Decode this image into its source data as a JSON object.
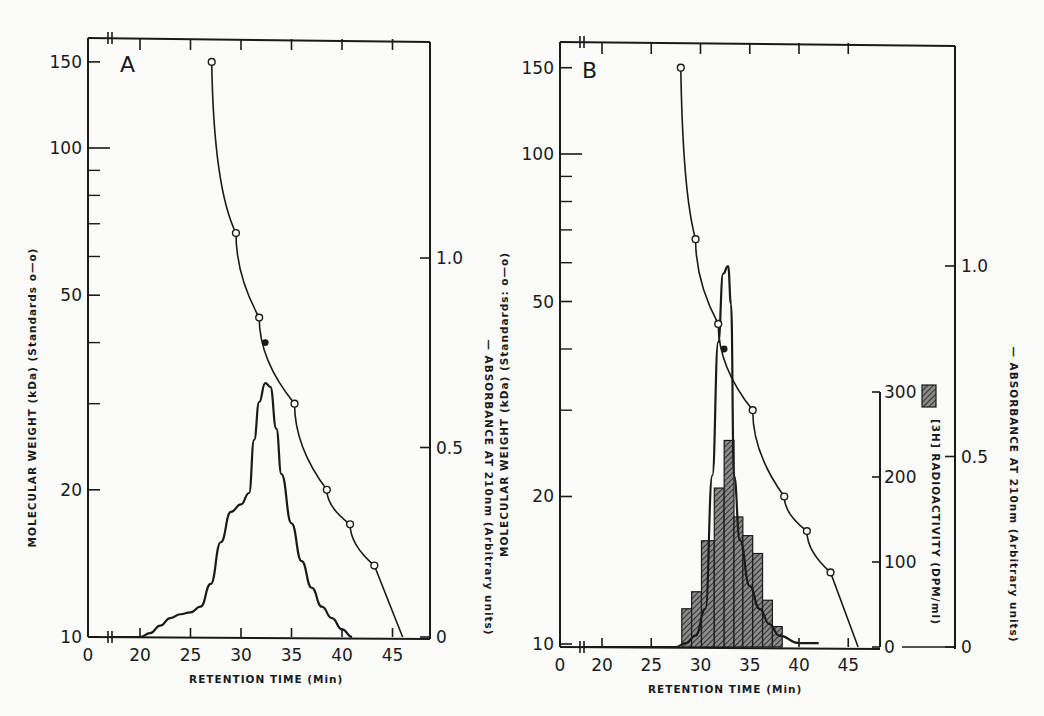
{
  "figure": {
    "panels": [
      {
        "label": "A",
        "xlabel": "RETENTION TIME (Min)",
        "ylabel_left": "MOLECULAR WEIGHT (kDa) (Standards o—o)",
        "ylabel_right": "— ABSORBANCE AT 210nm (Arbitrary units)",
        "x_ticks": [
          "0",
          "20",
          "25",
          "30",
          "35",
          "40",
          "45"
        ],
        "y_left_ticks": [
          "150",
          "100",
          "50",
          "20",
          "10"
        ],
        "y_right_ticks": [
          "1.0",
          "0.5",
          "0"
        ]
      },
      {
        "label": "B",
        "xlabel": "RETENTION TIME (Min)",
        "ylabel_left": "MOLECULAR WEIGHT (kDa) (Standards: o—o)",
        "ylabel_right": "— ABSORBANCE AT 210nm (Arbitrary units)",
        "ylabel_radio": "[3H] RADIOACTIVITY (DPM/ml)",
        "x_ticks": [
          "0",
          "20",
          "25",
          "30",
          "35",
          "40",
          "45"
        ],
        "y_left_ticks": [
          "150",
          "100",
          "50",
          "20",
          "10"
        ],
        "y_right_ticks": [
          "1.0",
          "0.5",
          "0"
        ],
        "y_radio_ticks": [
          "300",
          "200",
          "100",
          "0"
        ]
      }
    ]
  },
  "chart_data": [
    {
      "type": "line",
      "title": "A",
      "xlabel": "RETENTION TIME (Min)",
      "ylabel": "MOLECULAR WEIGHT (kDa) (Standards)",
      "y2label": "ABSORBANCE AT 210nm (Arbitrary units)",
      "xlim": [
        0,
        48
      ],
      "x_axis_break": "between 0 and 20",
      "ylim": [
        10,
        160
      ],
      "yscale": "log",
      "y2lim": [
        0,
        1.3
      ],
      "grid": false,
      "series": [
        {
          "name": "Standards (MW, kDa)",
          "marker": "open circle",
          "x": [
            27.1,
            29.5,
            31.8,
            35.3,
            38.5,
            40.8,
            43.2
          ],
          "y": [
            150,
            67,
            45,
            30,
            20,
            17,
            14
          ]
        },
        {
          "name": "Sample (filled point)",
          "marker": "filled circle",
          "x": [
            32.4
          ],
          "y": [
            40
          ]
        },
        {
          "name": "Absorbance at 210nm",
          "axis": "right",
          "x": [
            17,
            20,
            21,
            22,
            23,
            24,
            25,
            26,
            27,
            28,
            29,
            30,
            30.8,
            31.3,
            31.8,
            32.4,
            32.9,
            33.5,
            34.0,
            35.0,
            36.0,
            37.0,
            38.0,
            39.0,
            40.0,
            41.0
          ],
          "y": [
            0,
            0,
            0.01,
            0.03,
            0.05,
            0.06,
            0.065,
            0.08,
            0.14,
            0.25,
            0.33,
            0.35,
            0.38,
            0.52,
            0.62,
            0.67,
            0.66,
            0.55,
            0.43,
            0.3,
            0.2,
            0.13,
            0.08,
            0.05,
            0.02,
            0
          ]
        }
      ]
    },
    {
      "type": "line",
      "title": "B",
      "xlabel": "RETENTION TIME (Min)",
      "ylabel": "MOLECULAR WEIGHT (kDa) (Standards)",
      "y2label": "ABSORBANCE AT 210nm (Arbitrary units)",
      "y3label": "[3H] RADIOACTIVITY (DPM/ml)",
      "xlim": [
        0,
        48
      ],
      "x_axis_break": "between 0 and 20",
      "ylim": [
        10,
        160
      ],
      "yscale": "log",
      "y2lim": [
        0,
        1.3
      ],
      "y3lim": [
        0,
        300
      ],
      "grid": false,
      "series": [
        {
          "name": "Standards (MW, kDa)",
          "marker": "open circle",
          "x": [
            28.0,
            29.5,
            31.8,
            35.3,
            38.5,
            40.8,
            43.2
          ],
          "y": [
            150,
            67,
            45,
            30,
            20,
            17,
            14
          ]
        },
        {
          "name": "Sample (filled point)",
          "marker": "filled circle",
          "x": [
            32.4
          ],
          "y": [
            40
          ]
        },
        {
          "name": "Absorbance at 210nm",
          "axis": "right",
          "x": [
            17,
            20,
            25,
            27.5,
            28.5,
            29.5,
            30.5,
            31.2,
            31.8,
            32.3,
            32.8,
            33.1,
            33.4,
            34.0,
            35.0,
            36.0,
            37.0,
            38.0,
            40.0,
            42.0
          ],
          "y": [
            0,
            0,
            0,
            0,
            0.01,
            0.03,
            0.1,
            0.45,
            0.8,
            0.98,
            1.0,
            0.9,
            0.45,
            0.28,
            0.16,
            0.1,
            0.06,
            0.03,
            0.01,
            0.01
          ]
        },
        {
          "name": "[3H] Radioactivity (DPM/ml)",
          "type": "bar",
          "axis": "radio",
          "bin_edges": [
            28.1,
            29.1,
            30.1,
            31.4,
            32.4,
            33.4,
            34.3,
            35.3,
            36.3,
            37.3,
            38.3
          ],
          "values": [
            45,
            65,
            125,
            187,
            243,
            153,
            131,
            110,
            55,
            24
          ]
        }
      ]
    }
  ]
}
